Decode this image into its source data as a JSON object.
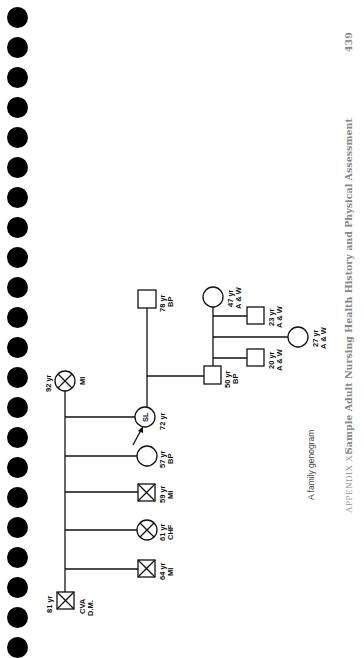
{
  "page": {
    "page_number": "439",
    "running_title": "Sample Adult Nursing Health History and Physical Assessment",
    "appendix_label": "APPENDIX XI",
    "caption": "A family genogram",
    "binding_holes": 22
  },
  "genogram": {
    "grandparents": {
      "grandfather": {
        "shape": "square",
        "deceased": true,
        "age": "81 yr",
        "conditions": [
          "CVA",
          "D.M."
        ]
      },
      "grandmother": {
        "shape": "circle",
        "deceased": true,
        "age": "92 yr",
        "conditions": [
          "MI"
        ]
      }
    },
    "generation2": [
      {
        "shape": "square",
        "deceased": true,
        "age": "64 yr",
        "conditions": [
          "MI"
        ]
      },
      {
        "shape": "circle",
        "deceased": true,
        "age": "61 yr",
        "conditions": [
          "CHF"
        ]
      },
      {
        "shape": "square",
        "deceased": true,
        "age": "59 yr",
        "conditions": [
          "MI"
        ]
      },
      {
        "shape": "circle",
        "deceased": false,
        "age": "57 yr",
        "conditions": [
          "BP"
        ]
      },
      {
        "shape": "circle",
        "deceased": false,
        "age": "72 yr",
        "initials": "SL",
        "index_client": true,
        "conditions": []
      }
    ],
    "spouse_of_index": {
      "shape": "square",
      "deceased": false,
      "age": "78 yr",
      "conditions": [
        "BP"
      ]
    },
    "generation3": {
      "child": {
        "shape": "square",
        "deceased": false,
        "age": "50 yr",
        "conditions": [
          "BP"
        ]
      },
      "child_spouse": {
        "shape": "circle",
        "deceased": false,
        "age": "47 yr",
        "conditions": [
          "A & W"
        ]
      }
    },
    "generation4": [
      {
        "shape": "square",
        "deceased": false,
        "age": "23 yr",
        "conditions": [
          "A & W"
        ]
      },
      {
        "shape": "circle",
        "deceased": false,
        "age": "27 yr",
        "conditions": [
          "A & W"
        ]
      },
      {
        "shape": "square",
        "deceased": false,
        "age": "20 yr",
        "conditions": [
          "A & W"
        ]
      }
    ]
  },
  "labels": {
    "gf_age": "81 yr",
    "gf_c1": "CVA",
    "gf_c2": "D.M.",
    "gm_age": "92 yr",
    "gm_c1": "MI",
    "s64_age": "64 yr",
    "s64_c": "MI",
    "s61_age": "61 yr",
    "s61_c": "CHF",
    "s59_age": "59 yr",
    "s59_c": "MI",
    "s57_age": "57 yr",
    "s57_c": "BP",
    "sl_init": "SL",
    "sl_age": "72 yr",
    "h78_age": "78 yr",
    "h78_c": "BP",
    "c50_age": "50 yr",
    "c50_c": "BP",
    "c47_age": "47 yr",
    "c47_c": "A & W",
    "g23_age": "23 yr",
    "g23_c": "A & W",
    "g27_age": "27 yr",
    "g27_c": "A & W",
    "g20_age": "20 yr",
    "g20_c": "A & W"
  }
}
